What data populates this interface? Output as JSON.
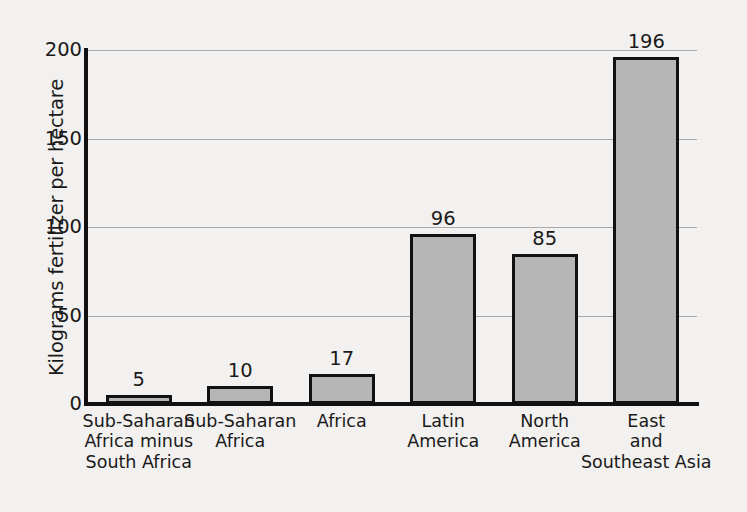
{
  "chart_data": {
    "type": "bar",
    "title": "",
    "subtitle": "",
    "xlabel": "",
    "ylabel": "Kilograms fertilizer per hectare",
    "categories": [
      "Sub-Saharan\nAfrica minus\nSouth Africa",
      "Sub-Saharan\nAfrica",
      "Africa",
      "Latin\nAmerica",
      "North\nAmerica",
      "East\nand\nSoutheast Asia"
    ],
    "category_lines": [
      [
        "Sub-Saharan",
        "Africa minus",
        "South Africa"
      ],
      [
        "Sub-Saharan",
        "Africa"
      ],
      [
        "Africa"
      ],
      [
        "Latin",
        "America"
      ],
      [
        "North",
        "America"
      ],
      [
        "East",
        "and",
        "Southeast Asia"
      ]
    ],
    "values": [
      5,
      10,
      17,
      96,
      85,
      196
    ],
    "value_labels": [
      "5",
      "10",
      "17",
      "96",
      "85",
      "196"
    ],
    "ylim": [
      0,
      200
    ],
    "yticks": [
      0,
      50,
      100,
      150,
      200
    ],
    "ytick_labels": [
      "0",
      "50",
      "100",
      "150",
      "200"
    ],
    "grid": true,
    "grid_axis": "y",
    "legend": false,
    "legend_position": "none",
    "bar_fill_color": "#b6b6b6",
    "bar_edge_color": "#111111",
    "background_color": "#eceae7",
    "gridline_color": "#a9a9a9",
    "text_color": "#1a1a1a"
  }
}
